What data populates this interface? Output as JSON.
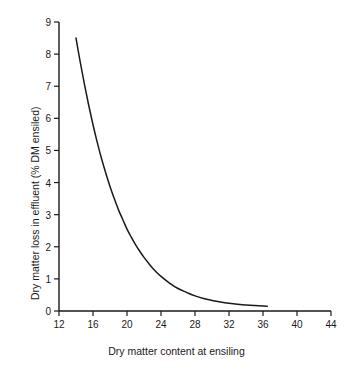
{
  "chart_data": {
    "type": "line",
    "title": "",
    "xlabel": "Dry matter content at ensiling",
    "ylabel": "Dry matter loss in effluent (% DM ensiled)",
    "xlim": [
      12,
      44
    ],
    "ylim": [
      0,
      9
    ],
    "xticks": [
      12,
      16,
      20,
      24,
      28,
      32,
      36,
      40,
      44
    ],
    "yticks": [
      0,
      1,
      2,
      3,
      4,
      5,
      6,
      7,
      8,
      9
    ],
    "xtick_labels": [
      "12",
      "16",
      "20",
      "24",
      "28",
      "32",
      "36",
      "40",
      "44"
    ],
    "ytick_labels": [
      "0",
      "1",
      "2",
      "3",
      "4",
      "5",
      "6",
      "7",
      "8",
      "9"
    ],
    "grid": false,
    "legend": null,
    "line_color": "#1a1a1a",
    "series": [
      {
        "name": "Dry matter loss in effluent",
        "x": [
          14.0,
          14.5,
          15.0,
          15.5,
          16.0,
          16.5,
          17.0,
          17.5,
          18.0,
          18.5,
          19.0,
          19.5,
          20.0,
          20.5,
          21.0,
          21.5,
          22.0,
          22.5,
          23.0,
          23.5,
          24.0,
          25.0,
          26.0,
          27.0,
          28.0,
          29.0,
          30.0,
          31.0,
          32.0,
          33.0,
          34.0,
          35.0,
          36.0,
          36.5
        ],
        "y": [
          8.5,
          7.75,
          7.05,
          6.4,
          5.8,
          5.25,
          4.75,
          4.3,
          3.88,
          3.5,
          3.15,
          2.85,
          2.55,
          2.3,
          2.07,
          1.86,
          1.67,
          1.5,
          1.34,
          1.2,
          1.08,
          0.87,
          0.7,
          0.58,
          0.47,
          0.39,
          0.33,
          0.28,
          0.24,
          0.21,
          0.19,
          0.17,
          0.155,
          0.15
        ]
      }
    ]
  },
  "axes": {
    "x_title": "Dry matter content at ensiling",
    "y_title": "Dry matter loss in effluent (% DM ensiled)"
  }
}
